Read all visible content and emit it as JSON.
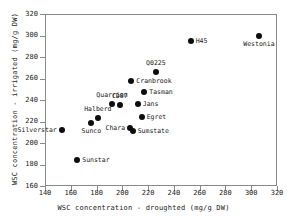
{
  "chart_data": {
    "type": "scatter",
    "title": "",
    "xlabel": "WSC concentration - droughted (mg/g DW)",
    "ylabel": "WSC concentration - irrigated (mg/g DW)",
    "xlim": [
      140,
      320
    ],
    "ylim": [
      160,
      320
    ],
    "xticks": [
      140,
      160,
      180,
      200,
      220,
      240,
      260,
      280,
      300,
      320
    ],
    "yticks": [
      160,
      180,
      200,
      220,
      240,
      260,
      280,
      300,
      320
    ],
    "grid": false,
    "legend": false,
    "marker": "filled-circle",
    "marker_color": "#0d0d0d",
    "points": [
      {
        "label": "Silverstar",
        "x": 153,
        "y": 212,
        "lblpos": "left"
      },
      {
        "label": "Sunstar",
        "x": 165,
        "y": 184,
        "lblpos": "right"
      },
      {
        "label": "Sunco",
        "x": 176,
        "y": 219,
        "lblpos": "below"
      },
      {
        "label": "Halberd",
        "x": 181,
        "y": 223,
        "lblpos": "above"
      },
      {
        "label": "Quarrion",
        "x": 192,
        "y": 236,
        "lblpos": "above"
      },
      {
        "label": "CD87",
        "x": 198,
        "y": 235,
        "lblpos": "above"
      },
      {
        "label": "Chara",
        "x": 206,
        "y": 214,
        "lblpos": "left"
      },
      {
        "label": "Sumstate",
        "x": 208,
        "y": 211,
        "lblpos": "right"
      },
      {
        "label": "Cranbrook",
        "x": 207,
        "y": 258,
        "lblpos": "right"
      },
      {
        "label": "Jans",
        "x": 212,
        "y": 236,
        "lblpos": "right"
      },
      {
        "label": "Egret",
        "x": 215,
        "y": 224,
        "lblpos": "right"
      },
      {
        "label": "Tasman",
        "x": 217,
        "y": 247,
        "lblpos": "right"
      },
      {
        "label": "Q0225",
        "x": 226,
        "y": 266,
        "lblpos": "above"
      },
      {
        "label": "H45",
        "x": 253,
        "y": 295,
        "lblpos": "right"
      },
      {
        "label": "Westonia",
        "x": 306,
        "y": 300,
        "lblpos": "below"
      }
    ]
  },
  "colors": {
    "axis": "#8a8a8a",
    "text": "#1a1a1a",
    "marker": "#0d0d0d",
    "background": "#ffffff"
  }
}
